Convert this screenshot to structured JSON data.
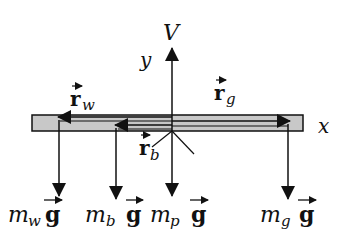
{
  "diagram": {
    "colors": {
      "bar_fill": "#c8c8c8",
      "stroke": "#111111",
      "background": "#ffffff"
    },
    "axes": {
      "y_label": "y",
      "x_label": "x"
    },
    "force_up": {
      "label": "V"
    },
    "position_vectors": {
      "r_w": {
        "symbol": "r",
        "sub": "w"
      },
      "r_g": {
        "symbol": "r",
        "sub": "g"
      },
      "r_b": {
        "symbol": "r",
        "sub": "b"
      }
    },
    "weights": [
      {
        "m": "m",
        "sub": "w",
        "g": "g"
      },
      {
        "m": "m",
        "sub": "b",
        "g": "g"
      },
      {
        "m": "m",
        "sub": "p",
        "g": "g"
      },
      {
        "m": "m",
        "sub": "g",
        "g": "g"
      }
    ]
  }
}
